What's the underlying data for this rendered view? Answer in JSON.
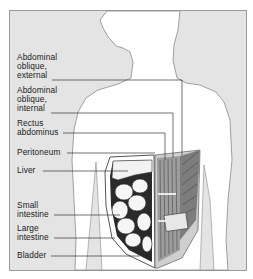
{
  "diagram": {
    "colors": {
      "background": "#e4e4e4",
      "body": "#ffffff",
      "outline": "#8a8a8a",
      "leader_line": "#333333",
      "text": "#1a1a1a"
    },
    "labels": [
      {
        "id": "abdominal-oblique-external",
        "text": "Abdominal\noblique,\nexternal"
      },
      {
        "id": "abdominal-oblique-internal",
        "text": "Abdominal\noblique,\ninternal"
      },
      {
        "id": "rectus-abdominus",
        "text": "Rectus\nabdominus"
      },
      {
        "id": "peritoneum",
        "text": "Peritoneum"
      },
      {
        "id": "liver",
        "text": "Liver"
      },
      {
        "id": "small-intestine",
        "text": "Small\nintestine"
      },
      {
        "id": "large-intestine",
        "text": "Large\nintestine"
      },
      {
        "id": "bladder",
        "text": "Bladder"
      }
    ]
  }
}
